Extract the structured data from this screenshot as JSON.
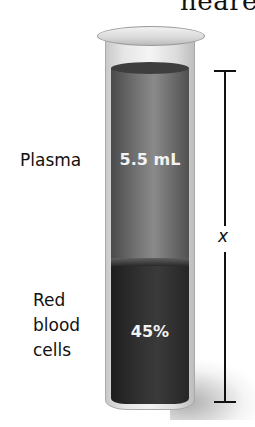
{
  "header": {
    "partial_text": "neare"
  },
  "diagram": {
    "plasma": {
      "label": "Plasma",
      "value": "5.5 mL",
      "color": "#6f6f6f"
    },
    "red_blood_cells": {
      "label_lines": [
        "Red",
        "blood",
        "cells"
      ],
      "value": "45%",
      "color": "#2e2e2e"
    },
    "dimension": {
      "variable": "x"
    }
  }
}
